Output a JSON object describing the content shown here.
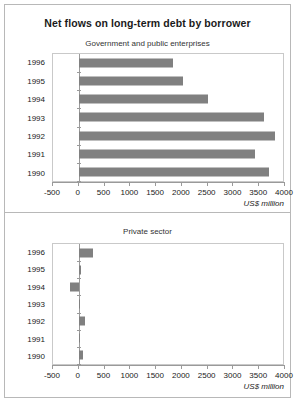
{
  "chart_data": [
    {
      "type": "bar",
      "orientation": "horizontal",
      "title": "Net flows on long-term debt by borrower",
      "subtitle": "Government and public enterprises",
      "categories": [
        "1996",
        "1995",
        "1994",
        "1993",
        "1992",
        "1991",
        "1990"
      ],
      "values": [
        1850,
        2050,
        2530,
        3620,
        3850,
        3450,
        3720
      ],
      "xlabel": "US$ million",
      "ylabel": "",
      "xlim": [
        -500,
        4000
      ],
      "xticks": [
        -500,
        0,
        500,
        1000,
        1500,
        2000,
        2500,
        3000,
        3500,
        4000
      ],
      "xticklabels": [
        "-500",
        "0",
        "500",
        "1000",
        "1500",
        "2000",
        "2500",
        "3000",
        "3500",
        "4000"
      ],
      "grid": false,
      "legend": null,
      "bar_color": "#808080"
    },
    {
      "type": "bar",
      "orientation": "horizontal",
      "title": "",
      "subtitle": "Private sector",
      "categories": [
        "1996",
        "1995",
        "1994",
        "1993",
        "1992",
        "1991",
        "1990"
      ],
      "values": [
        290,
        40,
        -170,
        35,
        120,
        5,
        80
      ],
      "xlabel": "US$ million",
      "ylabel": "",
      "xlim": [
        -500,
        4000
      ],
      "xticks": [
        -500,
        0,
        500,
        1000,
        1500,
        2000,
        2500,
        3000,
        3500,
        4000
      ],
      "xticklabels": [
        "-500",
        "0",
        "500",
        "1000",
        "1500",
        "2000",
        "2500",
        "3000",
        "3500",
        "4000"
      ],
      "grid": false,
      "legend": null,
      "bar_color": "#808080"
    }
  ],
  "figure": {
    "title": "Net flows on long-term debt by borrower",
    "panels": [
      {
        "subtitle": "Government and public enterprises",
        "units": "US$ million"
      },
      {
        "subtitle": "Private sector",
        "units": "US$ million"
      }
    ]
  }
}
